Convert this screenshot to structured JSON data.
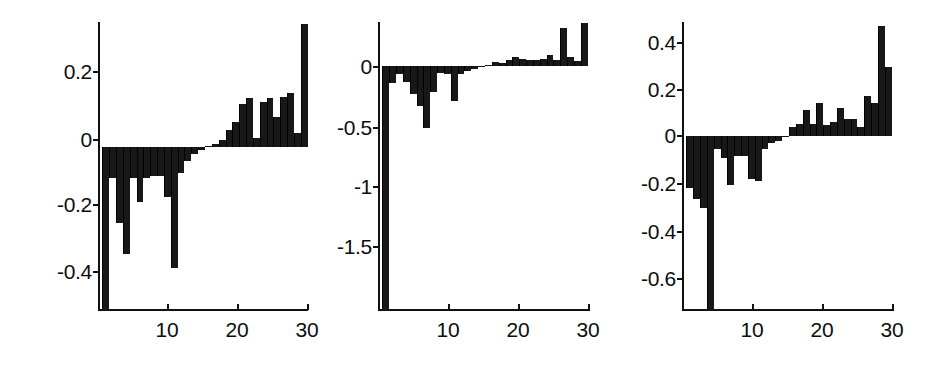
{
  "figure": {
    "background": "#ffffff",
    "bar_color": "#181818",
    "axis_color": "#111111",
    "panel_count": 3
  },
  "chart_data": [
    {
      "type": "bar",
      "title": "",
      "xlabel": "",
      "ylabel": "",
      "grid": false,
      "legend": null,
      "xlim": [
        0,
        31
      ],
      "ylim": [
        -0.47,
        0.36
      ],
      "yticks": [
        0.2,
        0,
        -0.2,
        -0.4
      ],
      "ytick_labels": [
        "0.2",
        "0",
        "-0.2",
        "-0.4"
      ],
      "xticks": [
        10,
        20,
        30
      ],
      "xtick_labels": [
        "10",
        "20",
        "30"
      ],
      "x": [
        1,
        2,
        3,
        4,
        5,
        6,
        7,
        8,
        9,
        10,
        11,
        12,
        13,
        14,
        15,
        16,
        17,
        18,
        19,
        20,
        21,
        22,
        23,
        24,
        25,
        26,
        27,
        28,
        29,
        30
      ],
      "values": [
        -0.47,
        -0.09,
        -0.22,
        -0.31,
        -0.09,
        -0.16,
        -0.09,
        -0.085,
        -0.085,
        -0.145,
        -0.35,
        -0.075,
        -0.04,
        -0.02,
        -0.008,
        0.004,
        0.009,
        0.02,
        0.048,
        0.072,
        0.125,
        0.14,
        0.027,
        0.13,
        0.14,
        0.085,
        0.145,
        0.155,
        0.04,
        0.355
      ]
    },
    {
      "type": "bar",
      "title": "",
      "xlabel": "",
      "ylabel": "",
      "grid": false,
      "legend": null,
      "xlim": [
        0,
        31
      ],
      "ylim": [
        -1.72,
        0.31
      ],
      "yticks": [
        0,
        -0.5,
        -1,
        -1.5
      ],
      "ytick_labels": [
        "0",
        "-0.5",
        "-1",
        "-1.5"
      ],
      "xticks": [
        10,
        20,
        30
      ],
      "xtick_labels": [
        "10",
        "20",
        "30"
      ],
      "x": [
        1,
        2,
        3,
        4,
        5,
        6,
        7,
        8,
        9,
        10,
        11,
        12,
        13,
        14,
        15,
        16,
        17,
        18,
        19,
        20,
        21,
        22,
        23,
        24,
        25,
        26,
        27,
        28,
        29,
        30
      ],
      "values": [
        -1.72,
        -0.12,
        -0.055,
        -0.11,
        -0.2,
        -0.28,
        -0.44,
        -0.18,
        -0.05,
        -0.055,
        -0.25,
        -0.06,
        -0.035,
        -0.02,
        -0.005,
        0.01,
        0.03,
        0.02,
        0.045,
        0.06,
        0.05,
        0.045,
        0.04,
        0.05,
        0.08,
        0.045,
        0.27,
        0.06,
        0.035,
        0.3
      ]
    },
    {
      "type": "bar",
      "title": "",
      "xlabel": "",
      "ylabel": "",
      "grid": false,
      "legend": null,
      "xlim": [
        0,
        31
      ],
      "ylim": [
        -0.72,
        0.47
      ],
      "yticks": [
        0.4,
        0.2,
        0,
        -0.2,
        -0.4,
        -0.6
      ],
      "ytick_labels": [
        "0.4",
        "0.2",
        "0",
        "-0.2",
        "-0.4",
        "-0.6"
      ],
      "xticks": [
        10,
        20,
        30
      ],
      "xtick_labels": [
        "10",
        "20",
        "30"
      ],
      "x": [
        1,
        2,
        3,
        4,
        5,
        6,
        7,
        8,
        9,
        10,
        11,
        12,
        13,
        14,
        15,
        16,
        17,
        18,
        19,
        20,
        21,
        22,
        23,
        24,
        25,
        26,
        27,
        28,
        29,
        30
      ],
      "values": [
        -0.215,
        -0.26,
        -0.3,
        -0.72,
        -0.055,
        -0.09,
        -0.205,
        -0.085,
        -0.085,
        -0.18,
        -0.185,
        -0.055,
        -0.03,
        -0.02,
        -0.006,
        0.035,
        0.05,
        0.105,
        0.05,
        0.135,
        0.045,
        0.055,
        0.115,
        0.07,
        0.07,
        0.035,
        0.165,
        0.135,
        0.455,
        0.285
      ]
    }
  ]
}
